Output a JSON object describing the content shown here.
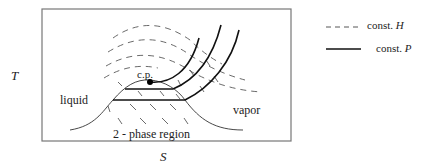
{
  "figure": {
    "axes": {
      "y_label": "T",
      "x_label": "S"
    },
    "regions": {
      "liquid": "liquid",
      "vapor": "vapor",
      "two_phase": "2 - phase region"
    },
    "critical_point_label": "c.p.",
    "legend": [
      {
        "style": "dashed",
        "label_prefix": "const. ",
        "label_var": "H"
      },
      {
        "style": "solid",
        "label_prefix": "const. ",
        "label_var": "P"
      }
    ]
  }
}
